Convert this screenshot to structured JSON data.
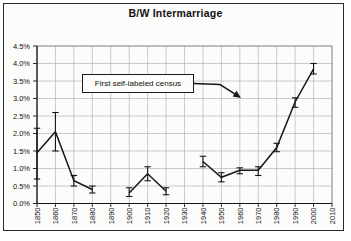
{
  "figure": {
    "title": "B/W Intermarriage",
    "annotation_label": "First self-labeled census"
  },
  "chart_data": {
    "type": "line",
    "title": "B/W Intermarriage",
    "xlabel": "",
    "ylabel": "",
    "xlim": [
      1850,
      2010
    ],
    "ylim": [
      0,
      4.5
    ],
    "grid": true,
    "legend": "none",
    "x_tick_labels": [
      "1850",
      "1860",
      "1870",
      "1880",
      "1890",
      "1900",
      "1910",
      "1920",
      "1930",
      "1940",
      "1950",
      "1960",
      "1970",
      "1980",
      "1990",
      "2000",
      "2010"
    ],
    "y_tick_labels": [
      "0.0%",
      "0.5%",
      "1.0%",
      "1.5%",
      "2.0%",
      "2.5%",
      "3.0%",
      "3.5%",
      "4.0%",
      "4.5%"
    ],
    "series": [
      {
        "name": "B/W intermarriage rate (%) with error bars",
        "gap_years": [
          1890,
          1930
        ],
        "points": [
          {
            "year": 1850,
            "value": 1.45,
            "err_low": 0.7,
            "err_high": 2.15
          },
          {
            "year": 1860,
            "value": 2.05,
            "err_low": 1.5,
            "err_high": 2.6
          },
          {
            "year": 1870,
            "value": 0.65,
            "err_low": 0.5,
            "err_high": 0.8
          },
          {
            "year": 1880,
            "value": 0.4,
            "err_low": 0.3,
            "err_high": 0.5
          },
          {
            "year": 1900,
            "value": 0.3,
            "err_low": 0.2,
            "err_high": 0.45
          },
          {
            "year": 1910,
            "value": 0.85,
            "err_low": 0.65,
            "err_high": 1.05
          },
          {
            "year": 1920,
            "value": 0.35,
            "err_low": 0.25,
            "err_high": 0.45
          },
          {
            "year": 1940,
            "value": 1.2,
            "err_low": 1.05,
            "err_high": 1.35
          },
          {
            "year": 1950,
            "value": 0.75,
            "err_low": 0.62,
            "err_high": 0.88
          },
          {
            "year": 1960,
            "value": 0.95,
            "err_low": 0.85,
            "err_high": 1.02
          },
          {
            "year": 1970,
            "value": 0.95,
            "err_low": 0.8,
            "err_high": 1.05
          },
          {
            "year": 1980,
            "value": 1.6,
            "err_low": 1.48,
            "err_high": 1.72
          },
          {
            "year": 1990,
            "value": 2.9,
            "err_low": 2.75,
            "err_high": 3.02
          },
          {
            "year": 2000,
            "value": 3.85,
            "err_low": 3.7,
            "err_high": 4.0
          }
        ]
      }
    ],
    "annotation": {
      "text": "First self-labeled census",
      "arrow_points_toward_year": 1970
    },
    "colors": {
      "line": "#161616",
      "grid": "#b5b5b5",
      "plot_border": "#8f8f8f",
      "axis": "#161616",
      "text": "#111111",
      "background": "#fcfcfa"
    }
  }
}
